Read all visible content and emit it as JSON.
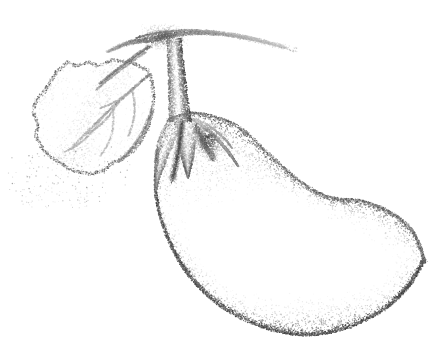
{
  "artwork": {
    "title": "Eggplant (Aubergine) with Calyx and Leaf",
    "subject": "eggplant",
    "medium": "stipple / pointillist ink drawing",
    "style": "monochrome dotted shading, no outlines, white background",
    "canvas": {
      "width": 444,
      "height": 353,
      "background_color": "#ffffff"
    },
    "ink_color": "#3a3a3a",
    "tone_range": {
      "lightest": "#ffffff",
      "mid": "#9a9a9a",
      "darkest": "#4a4a4a"
    },
    "parts": [
      {
        "name": "fruit-body",
        "label": "Eggplant fruit",
        "description": "Large curved pear/bean shaped body sweeping from upper-left down and to the right, rounded bulb at right end",
        "bbox": [
          150,
          112,
          428,
          338
        ],
        "shading": "dense stipple along lower-left and upper-right contours, sparse highlight through the middle"
      },
      {
        "name": "calyx",
        "label": "Calyx / sepals",
        "description": "Three to four pointed sepals fanning over the shoulder of the fruit with dark shadow clefts between them",
        "bbox": [
          152,
          105,
          240,
          190
        ],
        "shading": "darkest values of the drawing in the clefts between sepals"
      },
      {
        "name": "peduncle",
        "label": "Stem / peduncle",
        "description": "Vertical stalk rising from the calyx to the branch junction",
        "bbox": [
          160,
          36,
          192,
          120
        ]
      },
      {
        "name": "branch",
        "label": "Branch",
        "description": "Horizontal woody branch at the top, tapering to a fine point toward the upper right",
        "bbox": [
          110,
          18,
          290,
          56
        ]
      },
      {
        "name": "leaf-petiole",
        "label": "Leaf stalk",
        "description": "Thin stalk running down-left from the branch junction to the leaf base",
        "bbox": [
          92,
          44,
          152,
          96
        ]
      },
      {
        "name": "leaf",
        "label": "Lobed leaf",
        "description": "Broad lobed leaf at the left with visible midrib and secondary veins, stippled margin",
        "bbox": [
          30,
          58,
          152,
          180
        ],
        "veins": [
          "midrib",
          "secondary-vein-upper",
          "secondary-vein-middle",
          "secondary-vein-lower"
        ]
      },
      {
        "name": "stray-dots",
        "label": "Scattered stipple",
        "description": "Loose scattered dots trailing below and left of the leaf",
        "bbox": [
          8,
          150,
          120,
          200
        ]
      }
    ],
    "stipple": {
      "dot_radius_min": 0.35,
      "dot_radius_max": 0.75,
      "total_dots_approx": 34000
    }
  }
}
